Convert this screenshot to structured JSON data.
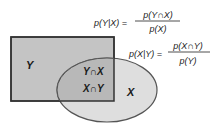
{
  "colors": {
    "rect_fill": "#c4c4c4",
    "ellipse_fill": "#dedede",
    "overlap_fill": "#b8b8b8",
    "rect_stroke": "#333333",
    "ellipse_stroke": "#555555",
    "text": "#1a1a1a"
  },
  "regions": {
    "y_label": "Y",
    "x_label": "X",
    "intersection_yx": "Y∩X",
    "intersection_xy": "X∩Y"
  },
  "formulas": [
    {
      "lhs": "p(Y|X) =",
      "numerator": "p(Y∩X)",
      "denominator": "p(X)"
    },
    {
      "lhs": "p(X|Y) =",
      "numerator": "p(X∩Y)",
      "denominator": "p(Y)"
    }
  ]
}
